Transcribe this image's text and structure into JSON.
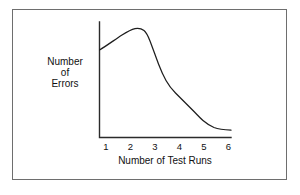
{
  "figure": {
    "frame_color": "#6e6e6e",
    "background": "#ffffff"
  },
  "chart_data": {
    "type": "line",
    "title": "",
    "subtitle": "",
    "xlabel": "Number of Test Runs",
    "ylabel": "Number of Errors",
    "ylabel_lines": [
      "Number",
      "of",
      "Errors"
    ],
    "xticks": [
      "1",
      "2",
      "3",
      "4",
      "5",
      "6"
    ],
    "yticks": [],
    "grid": false,
    "legend": null,
    "line_color": "#1e1e1e",
    "axis_color": "#2b2b2b",
    "xlim": [
      0.65,
      6.3
    ],
    "ylim": [
      0,
      10
    ],
    "x": [
      0.65,
      1.0,
      1.35,
      1.7,
      2.05,
      2.35,
      2.6,
      2.85,
      3.1,
      3.35,
      3.6,
      3.9,
      4.2,
      4.5,
      4.8,
      5.1,
      5.4,
      5.75,
      6.1,
      6.3
    ],
    "values": [
      7.4,
      8.1,
      8.7,
      9.2,
      9.45,
      9.35,
      9.0,
      8.1,
      6.9,
      6.0,
      5.3,
      4.6,
      4.1,
      3.5,
      2.9,
      2.3,
      1.7,
      1.15,
      0.85,
      0.8
    ],
    "series": [
      {
        "name": "Errors per test run",
        "values": [
          7.4,
          8.1,
          8.7,
          9.2,
          9.45,
          9.35,
          9.0,
          8.1,
          6.9,
          6.0,
          5.3,
          4.6,
          4.1,
          3.5,
          2.9,
          2.3,
          1.7,
          1.15,
          0.85,
          0.8
        ]
      }
    ],
    "annotations": []
  },
  "geometry": {
    "axis_path": "M 99.5 22 L 99.5 137.5 L 231 137.5",
    "curve_path": "M 99.5 50 C 107 45.5 115 39.5 122 35 C 127.5 31.5 131 29.5 135 28.6 C 139 27.8 141.5 28.6 144 30.6 C 146.5 32.6 148 36 150 41 C 152.5 47.5 155.5 56 158.5 64 C 161 70.5 163.5 76 166 80.5 C 169 85.8 172 89.5 175.5 93 C 179 96.5 182 99.5 185.5 103 C 188.5 106 191 108.5 194 111.5 C 197 114.5 199.5 117.5 203 120.5 C 206.5 123.5 210 125.8 214 127.5 C 218 129 223 129.8 231 130.2",
    "xtick_x": [
      106,
      130.5,
      155,
      179.5,
      204,
      228.5
    ],
    "xtick_label_y": 150,
    "xtitle_pos": [
      165,
      164
    ],
    "ylabel_pos": [
      65,
      0
    ],
    "ylabel_line_y": [
      65,
      76,
      87
    ]
  }
}
